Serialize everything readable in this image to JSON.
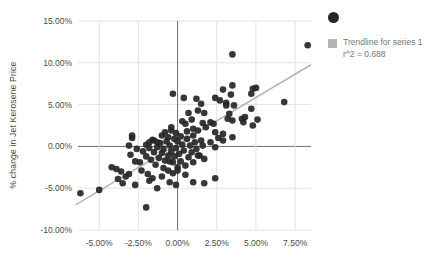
{
  "chart_data": {
    "type": "scatter",
    "title": "",
    "xlabel": "",
    "ylabel": "% change in Jet Kerosene Price",
    "x_ticks": [
      "-5.00%",
      "-2.50%",
      "0.00%",
      "2.50%",
      "5.00%",
      "7.50%"
    ],
    "x_tick_values": [
      -5,
      -2.5,
      0,
      2.5,
      5,
      7.5
    ],
    "y_ticks": [
      "15.00%",
      "10.00%",
      "5.00%",
      "0.00%",
      "-5.00%",
      "-10.00%"
    ],
    "y_tick_values": [
      15,
      10,
      5,
      0,
      -5,
      -10
    ],
    "xlim": [
      -6.35,
      8.51
    ],
    "ylim": [
      -10,
      15
    ],
    "grid": true,
    "legend_position": "right",
    "series": [
      {
        "name": "series 1",
        "points": [
          [
            8.3,
            12.1
          ],
          [
            3.5,
            11.0
          ],
          [
            6.8,
            5.3
          ],
          [
            -2.0,
            -7.3
          ],
          [
            -6.2,
            -5.6
          ],
          [
            -5.0,
            -5.2
          ],
          [
            4.8,
            6.9
          ],
          [
            5.0,
            7.0
          ],
          [
            4.7,
            6.3
          ],
          [
            2.9,
            6.8
          ],
          [
            3.5,
            7.3
          ],
          [
            0.4,
            5.8
          ],
          [
            -0.3,
            6.3
          ],
          [
            1.2,
            5.7
          ],
          [
            2.4,
            5.8
          ],
          [
            3.1,
            5.2
          ],
          [
            3.4,
            6.2
          ],
          [
            3.6,
            4.9
          ],
          [
            4.3,
            3.5
          ],
          [
            4.7,
            4.5
          ],
          [
            5.1,
            3.2
          ],
          [
            2.7,
            5.5
          ],
          [
            3.1,
            4.9
          ],
          [
            1.5,
            5.1
          ],
          [
            1.3,
            4.3
          ],
          [
            1.7,
            4.0
          ],
          [
            3.3,
            3.9
          ],
          [
            3.2,
            3.3
          ],
          [
            3.5,
            3.1
          ],
          [
            4.1,
            3.3
          ],
          [
            4.8,
            2.5
          ],
          [
            4.2,
            2.9
          ],
          [
            2.1,
            2.9
          ],
          [
            2.3,
            2.7
          ],
          [
            1.8,
            2.3
          ],
          [
            1.3,
            1.9
          ],
          [
            2.4,
            1.7
          ],
          [
            2.9,
            1.5
          ],
          [
            1.0,
            1.3
          ],
          [
            1.5,
            0.7
          ],
          [
            2.1,
            0.5
          ],
          [
            0.5,
            2.7
          ],
          [
            0.7,
            4.0
          ],
          [
            3.5,
            1.1
          ],
          [
            2.9,
            0.7
          ],
          [
            2.4,
            -0.1
          ],
          [
            1.4,
            -1.1
          ],
          [
            1.7,
            -1.5
          ],
          [
            2.6,
            1.0
          ],
          [
            1.6,
            0.1
          ],
          [
            -2.9,
            1.3
          ],
          [
            -3.1,
            0.1
          ],
          [
            -2.9,
            1.0
          ],
          [
            -1.8,
            0.5
          ],
          [
            -1.5,
            0.7
          ],
          [
            -1.3,
            0.5
          ],
          [
            -1.0,
            1.3
          ],
          [
            -0.8,
            1.7
          ],
          [
            -0.6,
            1.1
          ],
          [
            -0.4,
            1.9
          ],
          [
            -2.0,
            0.2
          ],
          [
            -4.2,
            -2.5
          ],
          [
            -3.9,
            -2.7
          ],
          [
            -3.6,
            -3.0
          ],
          [
            -3.3,
            -3.6
          ],
          [
            -3.0,
            -1.0
          ],
          [
            -2.7,
            -1.8
          ],
          [
            -2.4,
            -1.9
          ],
          [
            -3.8,
            -3.9
          ],
          [
            -3.5,
            -4.4
          ],
          [
            -3.1,
            -3.3
          ],
          [
            -2.7,
            -4.6
          ],
          [
            -1.8,
            -4.1
          ],
          [
            -1.3,
            -5.0
          ],
          [
            -0.1,
            -4.6
          ],
          [
            -0.5,
            -4.3
          ],
          [
            0.0,
            -2.5
          ],
          [
            -0.5,
            -1.8
          ],
          [
            1.0,
            -4.3
          ],
          [
            1.7,
            -4.4
          ],
          [
            2.4,
            -3.8
          ],
          [
            -1.9,
            -3.3
          ],
          [
            -1.0,
            -3.6
          ],
          [
            -0.3,
            -3.2
          ],
          [
            0.5,
            -3.4
          ],
          [
            -2.2,
            -0.6
          ],
          [
            -2.0,
            -1.2
          ],
          [
            -1.8,
            -0.2
          ],
          [
            -1.7,
            -1.6
          ],
          [
            -1.6,
            0.8
          ],
          [
            -1.5,
            -0.7
          ],
          [
            -1.4,
            -2.2
          ],
          [
            -1.3,
            -0.1
          ],
          [
            -1.2,
            -1.4
          ],
          [
            -1.1,
            0.4
          ],
          [
            -1.0,
            -0.8
          ],
          [
            -0.9,
            -2.6
          ],
          [
            -0.9,
            -0.3
          ],
          [
            -0.8,
            -1.7
          ],
          [
            -0.7,
            0.6
          ],
          [
            -0.6,
            -1.1
          ],
          [
            -0.6,
            -2.9
          ],
          [
            -0.5,
            0.1
          ],
          [
            -0.4,
            -0.6
          ],
          [
            -0.3,
            -1.9
          ],
          [
            -0.2,
            0.9
          ],
          [
            -0.2,
            -1.2
          ],
          [
            -0.1,
            -0.2
          ],
          [
            0.0,
            -2.9
          ],
          [
            0.0,
            0.6
          ],
          [
            0.1,
            -0.9
          ],
          [
            0.2,
            -1.8
          ],
          [
            0.3,
            0.2
          ],
          [
            0.4,
            -0.5
          ],
          [
            0.5,
            -2.3
          ],
          [
            0.6,
            0.9
          ],
          [
            0.7,
            -1.3
          ],
          [
            0.8,
            0.1
          ],
          [
            0.9,
            -0.7
          ],
          [
            1.0,
            -1.9
          ],
          [
            1.1,
            0.5
          ],
          [
            1.2,
            -0.3
          ],
          [
            1.3,
            -1.1
          ],
          [
            0.2,
            1.2
          ],
          [
            -0.1,
            1.6
          ],
          [
            0.6,
            1.8
          ],
          [
            1.0,
            2.1
          ],
          [
            -0.4,
            2.3
          ],
          [
            0.3,
            3.0
          ],
          [
            0.9,
            3.2
          ],
          [
            1.6,
            2.8
          ],
          [
            -1.6,
            -3.8
          ],
          [
            -2.3,
            -2.9
          ],
          [
            -2.6,
            -0.3
          ]
        ]
      }
    ],
    "trendline": {
      "label": "Trendline for series 1",
      "r2_label": "r^2 = 0.688",
      "r_squared": 0.688,
      "start": [
        -6.5,
        -7.0
      ],
      "end": [
        8.51,
        9.76
      ]
    }
  },
  "colors": {
    "background": "#ffffff",
    "point": "#262626",
    "trendline": "#b5b5b5",
    "gridline": "#e2e2e2",
    "zero_axis": "#6e6e6e",
    "tick_text": "#4a4a4a",
    "legend_text": "#757575"
  }
}
